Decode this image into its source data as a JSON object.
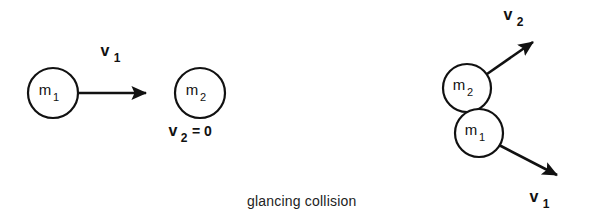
{
  "figure": {
    "caption": "glancing  collision",
    "background_color": "#ffffff",
    "stroke_color": "#111111"
  },
  "before": {
    "section_name": "before-collision",
    "body_1": {
      "label": "m",
      "subscript": "1",
      "cx": 53,
      "cy": 93,
      "r": 25
    },
    "body_2": {
      "label": "m",
      "subscript": "2",
      "cx": 200,
      "cy": 93,
      "r": 25
    },
    "velocity_1": {
      "label": "v",
      "subscript": "1",
      "x1": 79,
      "y1": 93,
      "x2": 152,
      "y2": 93
    },
    "velocity_2": {
      "label": "v",
      "subscript": "2",
      "equals": "= 0"
    }
  },
  "after": {
    "section_name": "after-collision",
    "body_2": {
      "label": "m",
      "subscript": "2",
      "cx": 467,
      "cy": 88,
      "r": 24
    },
    "body_1": {
      "label": "m",
      "subscript": "1",
      "cx": 479,
      "cy": 133,
      "r": 24
    },
    "velocity_2": {
      "label": "v",
      "subscript": "2",
      "x1": 487,
      "y1": 74,
      "x2": 538,
      "y2": 38
    },
    "velocity_1": {
      "label": "v",
      "subscript": "1",
      "x1": 499,
      "y1": 145,
      "x2": 563,
      "y2": 178
    }
  }
}
